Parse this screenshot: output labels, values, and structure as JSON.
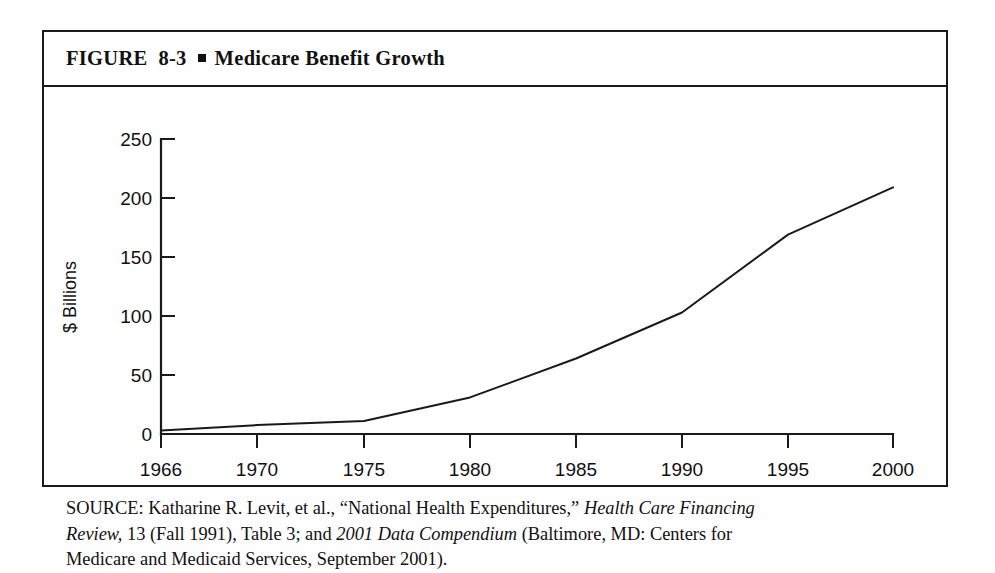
{
  "figure": {
    "label": "FIGURE  8-3",
    "bullet": "■",
    "title": "Medicare Benefit Growth"
  },
  "source": {
    "line1_a": "SOURCE: Katharine R. Levit, et al., “National Health Expenditures,” ",
    "line1_i": "Health Care Financing",
    "line2_i1": "Review,",
    "line2_a": " 13 (Fall 1991), Table 3; and ",
    "line2_i2": "2001 Data Compendium",
    "line2_b": " (Baltimore, MD: Centers for",
    "line3": "Medicare and Medicaid Services, September 2001)."
  },
  "chart_data": {
    "type": "line",
    "title": "Medicare Benefit Growth",
    "xlabel": "",
    "ylabel": "$ Billions",
    "x": [
      1966,
      1970,
      1975,
      1980,
      1985,
      1990,
      1995,
      2000
    ],
    "xtick_labels": [
      "1966",
      "1970",
      "1975",
      "1980",
      "1985",
      "1990",
      "1995",
      "2000"
    ],
    "values": [
      3,
      7.5,
      11,
      31,
      64,
      103,
      169,
      209
    ],
    "series": [
      {
        "name": "Medicare benefit payments",
        "values": [
          3,
          7.5,
          11,
          31,
          64,
          103,
          169,
          209
        ]
      }
    ],
    "ytick_labels": [
      "0",
      "50",
      "100",
      "150",
      "200",
      "250"
    ],
    "yticks": [
      0,
      50,
      100,
      150,
      200,
      250
    ],
    "ylim": [
      0,
      250
    ],
    "xlim": [
      1966,
      2000
    ],
    "grid": false,
    "legend": false,
    "line_color": "#1a1a1a"
  }
}
